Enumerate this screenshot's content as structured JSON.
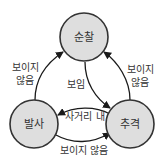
{
  "diagram": {
    "type": "state-machine",
    "nodes": [
      {
        "id": "patrol",
        "label": "순찰"
      },
      {
        "id": "fire",
        "label": "발사"
      },
      {
        "id": "chase",
        "label": "추격"
      }
    ],
    "edges": [
      {
        "from": "patrol",
        "to": "chase",
        "label": "보임"
      },
      {
        "from": "chase",
        "to": "patrol",
        "label_line1": "보이지",
        "label_line2": "않음"
      },
      {
        "from": "fire",
        "to": "patrol",
        "label_line1": "보이지",
        "label_line2": "않음"
      },
      {
        "from": "chase",
        "to": "fire",
        "label": "사거리 내"
      },
      {
        "from": "fire",
        "to": "chase",
        "label": "보이지 않음"
      }
    ],
    "colors": {
      "node_fill": "#dedede",
      "node_stroke": "#333333",
      "edge": "#1a1a1a",
      "text": "#333333"
    }
  }
}
